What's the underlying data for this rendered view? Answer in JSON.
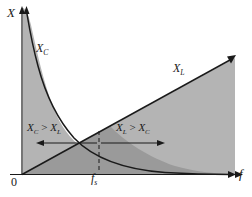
{
  "figure": {
    "axes": {
      "y_label": "X",
      "x_label": "f",
      "origin_label": "0",
      "tick_label": "f",
      "tick_sub": "s"
    },
    "curves": [
      {
        "name": "capacitive-reactance",
        "label": "X",
        "sub": "C",
        "shape": "hyperbolic-decay"
      },
      {
        "name": "inductive-reactance",
        "label": "X",
        "sub": "L",
        "shape": "linear-rise"
      }
    ],
    "regions": [
      {
        "name": "capacitive-region",
        "left": "X",
        "left_sub": "C",
        "op": " > ",
        "right": "X",
        "right_sub": "L"
      },
      {
        "name": "inductive-region",
        "left": "X",
        "left_sub": "L",
        "op": " > ",
        "right": "X",
        "right_sub": "C"
      }
    ],
    "colors": {
      "fill_light": "#b4b4b4",
      "fill_dark": "#9a9a9a",
      "stroke": "#1a1a1a",
      "background": "#ffffff"
    }
  }
}
